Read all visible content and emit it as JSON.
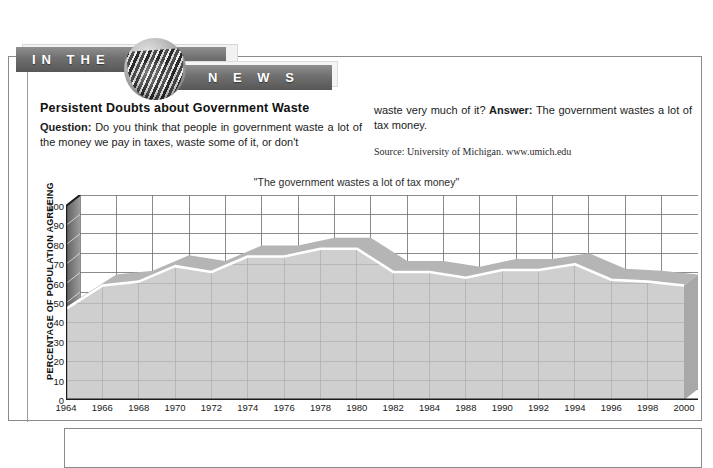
{
  "banner": {
    "left_text": "IN THE",
    "right_text": "N E W S",
    "logo_icon": "rolled-newspaper-icon"
  },
  "article": {
    "headline": "Persistent Doubts about Government Waste",
    "question_label": "Question:",
    "question_text": " Do you think that people in government waste a lot of the money we pay in taxes, waste some of it, or don't",
    "question_continued": "waste very much of it? ",
    "answer_label": "Answer:",
    "answer_text": " The government wastes a lot of tax money.",
    "source": "Source: University of Michigan. www.umich.edu"
  },
  "chart_data": {
    "type": "area",
    "title": "\"The government wastes a lot of tax money\"",
    "xlabel": "",
    "ylabel": "PERCENTAGE OF POPULATION AGREEING",
    "ylim": [
      0,
      100
    ],
    "yticks": [
      0,
      10,
      20,
      30,
      40,
      50,
      60,
      70,
      80,
      90,
      100
    ],
    "xtick_labels": [
      "1964",
      "1966",
      "1968",
      "1970",
      "1972",
      "1974",
      "1976",
      "1978",
      "1980",
      "1982",
      "1984",
      "1988",
      "1990",
      "1992",
      "1994",
      "1996",
      "1998",
      "2000"
    ],
    "grid": true,
    "legend": "none",
    "series": [
      {
        "name": "The government wastes a lot of tax money",
        "x": [
          "1964",
          "1966",
          "1968",
          "1970",
          "1972",
          "1974",
          "1976",
          "1978",
          "1980",
          "1982",
          "1984",
          "1988",
          "1990",
          "1992",
          "1994",
          "1996",
          "1998",
          "2000"
        ],
        "values": [
          47,
          59,
          61,
          69,
          66,
          74,
          74,
          78,
          78,
          66,
          66,
          63,
          67,
          67,
          70,
          62,
          61,
          59
        ]
      }
    ],
    "style": {
      "fill_color": "#cfcfcf",
      "ribbon_color": "#b5b5b5",
      "line_color": "#ffffff",
      "grid_color": "#6e6e6e",
      "axis_color": "#1a1a1a",
      "plot_bg": "#ffffff",
      "depth_shade": "#a8a8a8"
    }
  }
}
